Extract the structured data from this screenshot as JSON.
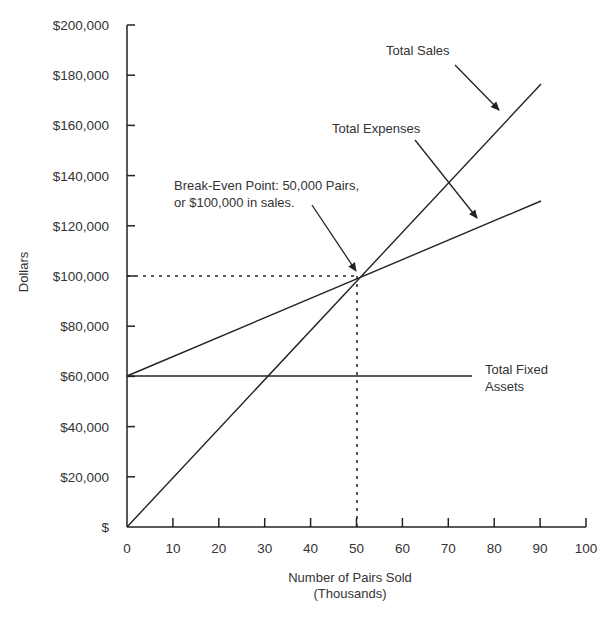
{
  "chart_data": {
    "type": "line",
    "title": "",
    "xlabel": "Number of Pairs Sold",
    "xlabel_sub": "(Thousands)",
    "ylabel": "Dollars",
    "xlim": [
      0,
      100
    ],
    "ylim": [
      0,
      200000
    ],
    "grid": false,
    "x_ticks": [
      "0",
      "10",
      "20",
      "30",
      "40",
      "50",
      "60",
      "70",
      "80",
      "90",
      "100"
    ],
    "y_ticks": [
      "$",
      "$20,000",
      "$40,000",
      "$60,000",
      "$80,000",
      "$100,000",
      "$120,000",
      "$140,000",
      "$160,000",
      "$180,000",
      "$200,000"
    ],
    "series": [
      {
        "name": "Total Sales",
        "x": [
          0,
          90
        ],
        "y": [
          0,
          176000
        ]
      },
      {
        "name": "Total Expenses",
        "x": [
          0,
          90
        ],
        "y": [
          60000,
          130000
        ]
      },
      {
        "name": "Total Fixed Assets",
        "x": [
          0,
          75
        ],
        "y": [
          60000,
          60000
        ]
      }
    ],
    "annotations": [
      {
        "text": "Total Sales",
        "points_to": "Total Sales line near x=82"
      },
      {
        "text": "Total Expenses",
        "points_to": "Total Expenses line near x=77"
      },
      {
        "text": "Break-Even Point: 50,000 Pairs, or $100,000 in sales.",
        "x": 50,
        "y": 100000
      },
      {
        "text": "Total Fixed Assets",
        "points_to": "Fixed line at $60,000"
      }
    ],
    "break_even": {
      "x": 50,
      "y": 100000
    }
  },
  "labels": {
    "total_sales": "Total Sales",
    "total_expenses": "Total Expenses",
    "break_even_line1": "Break-Even Point: 50,000 Pairs,",
    "break_even_line2": "or $100,000 in sales.",
    "fixed_line1": "Total Fixed",
    "fixed_line2": "Assets",
    "xlabel": "Number of Pairs Sold",
    "xlabel_sub": "(Thousands)",
    "ylabel": "Dollars"
  }
}
